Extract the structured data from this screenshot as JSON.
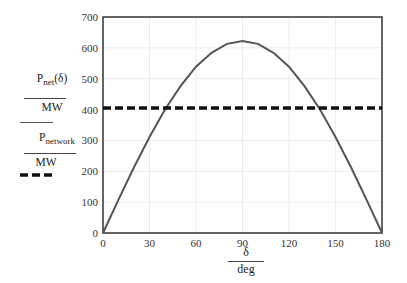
{
  "chart_data": {
    "type": "line",
    "title": "",
    "xlabel_num": "δ",
    "xlabel_den": "deg",
    "ylabel": "",
    "xlim": [
      0,
      180
    ],
    "ylim": [
      0,
      700
    ],
    "x_ticks": [
      0,
      30,
      60,
      90,
      120,
      150,
      180
    ],
    "y_ticks": [
      0,
      100,
      200,
      300,
      400,
      500,
      600,
      700
    ],
    "grid": true,
    "legend_position": "left",
    "series": [
      {
        "name": "P_net(δ)/MW",
        "style": "solid",
        "color": "#555555",
        "x": [
          0,
          10,
          20,
          30,
          40,
          50,
          60,
          70,
          80,
          90,
          100,
          110,
          120,
          130,
          140,
          150,
          160,
          170,
          180
        ],
        "values": [
          0,
          108,
          213,
          311,
          400,
          476,
          539,
          584,
          613,
          622,
          613,
          584,
          539,
          476,
          400,
          311,
          213,
          108,
          0
        ]
      },
      {
        "name": "P_network/MW",
        "style": "dashed",
        "color": "#111111",
        "x": [
          0,
          180
        ],
        "values": [
          405,
          405
        ]
      }
    ]
  },
  "legend": {
    "s1_main": "P",
    "s1_sub": "net",
    "s1_arg": "(δ)",
    "s1_den": "MW",
    "s2_main": "P",
    "s2_sub": "network",
    "s2_den": "MW"
  },
  "axis": {
    "x_num": "δ",
    "x_den": "deg"
  }
}
